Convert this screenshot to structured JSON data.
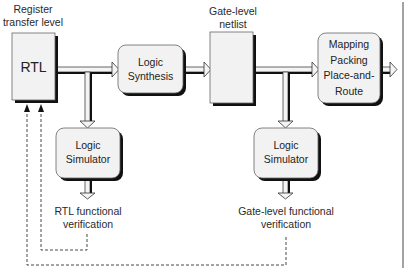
{
  "diagram": {
    "title_labels": {
      "register_transfer_level": [
        "Register",
        "transfer level"
      ],
      "gate_level_netlist": [
        "Gate-level",
        "netlist"
      ]
    },
    "nodes": {
      "rtl": {
        "label": "RTL"
      },
      "logic_synthesis": {
        "label": [
          "Logic",
          "Synthesis"
        ]
      },
      "gate_netlist": {
        "label": ""
      },
      "mapping": {
        "label": [
          "Mapping",
          "Packing",
          "Place-and-",
          "Route"
        ]
      },
      "logic_simulator_rtl": {
        "label": [
          "Logic",
          "Simulator"
        ]
      },
      "logic_simulator_gate": {
        "label": [
          "Logic",
          "Simulator"
        ]
      }
    },
    "outputs": {
      "rtl_verification": [
        "RTL functional",
        "verification"
      ],
      "gate_verification": [
        "Gate-level functional",
        "verification"
      ]
    },
    "edges": [
      {
        "from": "rtl",
        "to": "logic_synthesis",
        "style": "hollow-arrow"
      },
      {
        "from": "rtl",
        "to": "logic_simulator_rtl",
        "style": "hollow-arrow"
      },
      {
        "from": "logic_synthesis",
        "to": "gate_netlist",
        "style": "hollow-arrow"
      },
      {
        "from": "gate_netlist",
        "to": "mapping",
        "style": "hollow-arrow"
      },
      {
        "from": "gate_netlist",
        "to": "logic_simulator_gate",
        "style": "hollow-arrow"
      },
      {
        "from": "mapping",
        "to": "output",
        "style": "hollow-arrow"
      },
      {
        "from": "logic_simulator_rtl",
        "to": "rtl_verification",
        "style": "hollow-arrow"
      },
      {
        "from": "logic_simulator_gate",
        "to": "gate_verification",
        "style": "hollow-arrow"
      },
      {
        "from": "rtl_verification",
        "to": "rtl",
        "style": "dashed-feedback"
      },
      {
        "from": "gate_verification",
        "to": "rtl",
        "style": "dashed-feedback"
      }
    ],
    "colors": {
      "box_fill": "#f2f2f2",
      "shadow": "#111111",
      "outline": "#555555",
      "dashed": "#333333"
    }
  }
}
